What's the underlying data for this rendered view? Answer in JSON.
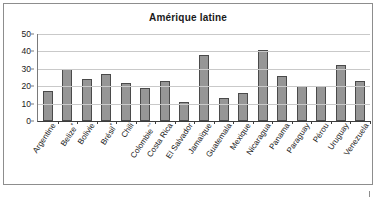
{
  "chart_data": {
    "type": "bar",
    "title": "Amérique latine",
    "xlabel": "",
    "ylabel": "",
    "ylim": [
      0,
      50
    ],
    "yticks": [
      0,
      10,
      20,
      30,
      40,
      50
    ],
    "grid": true,
    "legend": "none",
    "categories": [
      "Argentine",
      "Belize*",
      "Bolivie",
      "Brésil*",
      "Chili",
      "Colombie °°",
      "Costa Rica",
      "El Salvador",
      "Jamaïque",
      "Guatemala",
      "Mexique",
      "Nicaragua",
      "Panama",
      "Paraguay",
      "Pérou",
      "Uruguay",
      "Venezuela"
    ],
    "values": [
      17,
      30,
      24,
      27,
      22,
      19,
      23,
      11,
      38,
      13,
      16,
      41,
      26,
      20,
      20,
      32,
      23
    ],
    "series": [
      {
        "name": "Amérique latine",
        "color": "#969696",
        "values": [
          17,
          30,
          24,
          27,
          22,
          19,
          23,
          11,
          38,
          13,
          16,
          41,
          26,
          20,
          20,
          32,
          23
        ]
      }
    ]
  },
  "colors": {
    "bar_fill": "#969696",
    "bar_stroke": "#4a4a4a",
    "gridline": "#c9c9c9",
    "axis": "#3c3c3c",
    "frame": "#8d8d8d",
    "text": "#1a1a1a"
  }
}
